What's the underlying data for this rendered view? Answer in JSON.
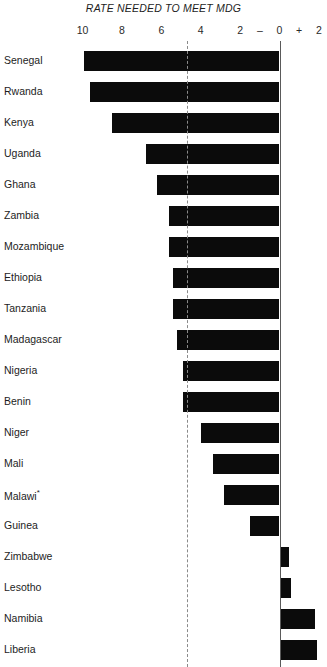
{
  "chart_data": {
    "type": "bar",
    "title": "RATE NEEDED TO MEET MDG",
    "xlabel": "",
    "ylabel": "",
    "orientation": "horizontal",
    "grid": false,
    "legend": null,
    "axis_ticks": [
      {
        "label": "10",
        "value": 10
      },
      {
        "label": "8",
        "value": 8
      },
      {
        "label": "6",
        "value": 6
      },
      {
        "label": "4",
        "value": 4
      },
      {
        "label": "2",
        "value": 2
      },
      {
        "label": "–",
        "value": 1
      },
      {
        "label": "0",
        "value": 0
      },
      {
        "label": "+",
        "value": -1
      },
      {
        "label": "2",
        "value": -2
      }
    ],
    "xlim": [
      11,
      -2.4
    ],
    "reference_line": {
      "label": "MDG target",
      "value": 4.7,
      "style": "dashed"
    },
    "zero_line": {
      "value": 0,
      "style": "solid"
    },
    "categories": [
      "Senegal",
      "Rwanda",
      "Kenya",
      "Uganda",
      "Ghana",
      "Zambia",
      "Mozambique",
      "Ethiopia",
      "Tanzania",
      "Madagascar",
      "Nigeria",
      "Benin",
      "Niger",
      "Mali",
      "Malawi",
      "Guinea",
      "Zimbabwe",
      "Lesotho",
      "Namibia",
      "Liberia"
    ],
    "values": [
      9.9,
      9.6,
      8.5,
      6.8,
      6.2,
      5.6,
      5.6,
      5.4,
      5.4,
      5.2,
      4.9,
      4.9,
      4.0,
      3.4,
      2.8,
      1.5,
      -0.5,
      -0.6,
      -1.8,
      -1.9
    ],
    "footnotes": [
      "Malawi*"
    ]
  },
  "chart": {
    "title": "RATE NEEDED TO MEET MDG",
    "rows": [
      {
        "label": "Senegal",
        "value": 9.9,
        "note": ""
      },
      {
        "label": "Rwanda",
        "value": 9.6,
        "note": ""
      },
      {
        "label": "Kenya",
        "value": 8.5,
        "note": ""
      },
      {
        "label": "Uganda",
        "value": 6.8,
        "note": ""
      },
      {
        "label": "Ghana",
        "value": 6.2,
        "note": ""
      },
      {
        "label": "Zambia",
        "value": 5.6,
        "note": ""
      },
      {
        "label": "Mozambique",
        "value": 5.6,
        "note": ""
      },
      {
        "label": "Ethiopia",
        "value": 5.4,
        "note": ""
      },
      {
        "label": "Tanzania",
        "value": 5.4,
        "note": ""
      },
      {
        "label": "Madagascar",
        "value": 5.2,
        "note": ""
      },
      {
        "label": "Nigeria",
        "value": 4.9,
        "note": ""
      },
      {
        "label": "Benin",
        "value": 4.9,
        "note": ""
      },
      {
        "label": "Niger",
        "value": 4.0,
        "note": ""
      },
      {
        "label": "Mali",
        "value": 3.4,
        "note": ""
      },
      {
        "label": "Malawi",
        "value": 2.8,
        "note": "*"
      },
      {
        "label": "Guinea",
        "value": 1.5,
        "note": ""
      },
      {
        "label": "Zimbabwe",
        "value": -0.5,
        "note": ""
      },
      {
        "label": "Lesotho",
        "value": -0.6,
        "note": ""
      },
      {
        "label": "Namibia",
        "value": -1.8,
        "note": ""
      },
      {
        "label": "Liberia",
        "value": -1.9,
        "note": ""
      }
    ]
  }
}
